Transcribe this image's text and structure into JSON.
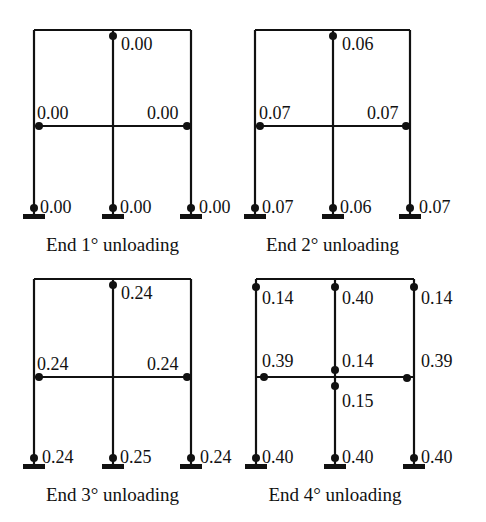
{
  "figure": {
    "type": "frame-damage-diagram"
  },
  "colors": {
    "line": "#111111",
    "hinge": "#111111",
    "background": "#ffffff"
  },
  "panels": [
    {
      "caption": "End 1° unloading",
      "origin": {
        "left": 34,
        "mid": 113,
        "right": 191,
        "top": 30,
        "beam": 126,
        "base": 215
      },
      "hinges": [
        {
          "id": "top-mid",
          "x": 113,
          "y": 36,
          "label": "0.00",
          "lx": 121,
          "ly": 50
        },
        {
          "id": "beam-left",
          "x": 39,
          "y": 126,
          "label": "0.00",
          "lx": 37,
          "ly": 119
        },
        {
          "id": "beam-right",
          "x": 187,
          "y": 126,
          "label": "0.00",
          "lx": 147,
          "ly": 119
        },
        {
          "id": "base-left",
          "x": 34,
          "y": 208,
          "label": "0.00",
          "lx": 40,
          "ly": 213
        },
        {
          "id": "base-mid",
          "x": 113,
          "y": 208,
          "label": "0.00",
          "lx": 120,
          "ly": 213
        },
        {
          "id": "base-right",
          "x": 191,
          "y": 208,
          "label": "0.00",
          "lx": 199,
          "ly": 213
        }
      ]
    },
    {
      "caption": "End 2° unloading",
      "origin": {
        "left": 255,
        "mid": 333,
        "right": 410,
        "top": 30,
        "beam": 126,
        "base": 215
      },
      "hinges": [
        {
          "id": "top-mid",
          "x": 333,
          "y": 36,
          "label": "0.06",
          "lx": 342,
          "ly": 50
        },
        {
          "id": "beam-left",
          "x": 260,
          "y": 126,
          "label": "0.07",
          "lx": 259,
          "ly": 119
        },
        {
          "id": "beam-right",
          "x": 406,
          "y": 126,
          "label": "0.07",
          "lx": 367,
          "ly": 119
        },
        {
          "id": "base-left",
          "x": 255,
          "y": 208,
          "label": "0.07",
          "lx": 262,
          "ly": 213
        },
        {
          "id": "base-mid",
          "x": 333,
          "y": 208,
          "label": "0.06",
          "lx": 340,
          "ly": 213
        },
        {
          "id": "base-right",
          "x": 410,
          "y": 208,
          "label": "0.07",
          "lx": 419,
          "ly": 213
        }
      ]
    },
    {
      "caption": "End 3° unloading",
      "origin": {
        "left": 34,
        "mid": 113,
        "right": 191,
        "top": 279,
        "beam": 377,
        "base": 465
      },
      "hinges": [
        {
          "id": "top-mid",
          "x": 113,
          "y": 285,
          "label": "0.24",
          "lx": 121,
          "ly": 299
        },
        {
          "id": "beam-left",
          "x": 39,
          "y": 377,
          "label": "0.24",
          "lx": 37,
          "ly": 370
        },
        {
          "id": "beam-right",
          "x": 187,
          "y": 377,
          "label": "0.24",
          "lx": 147,
          "ly": 370
        },
        {
          "id": "base-left",
          "x": 34,
          "y": 458,
          "label": "0.24",
          "lx": 42,
          "ly": 463
        },
        {
          "id": "base-mid",
          "x": 113,
          "y": 458,
          "label": "0.25",
          "lx": 120,
          "ly": 463
        },
        {
          "id": "base-right",
          "x": 191,
          "y": 458,
          "label": "0.24",
          "lx": 200,
          "ly": 463
        }
      ]
    },
    {
      "caption": "End 4° unloading",
      "origin": {
        "left": 256,
        "mid": 335,
        "right": 414,
        "top": 279,
        "beam": 377,
        "base": 465
      },
      "hinges": [
        {
          "id": "top-left",
          "x": 256,
          "y": 287,
          "label": "0.14",
          "lx": 262,
          "ly": 304
        },
        {
          "id": "top-mid",
          "x": 335,
          "y": 287,
          "label": "0.40",
          "lx": 342,
          "ly": 304
        },
        {
          "id": "top-right",
          "x": 414,
          "y": 287,
          "label": "0.14",
          "lx": 421,
          "ly": 304
        },
        {
          "id": "beam-left",
          "x": 264,
          "y": 377,
          "label": "0.39",
          "lx": 262,
          "ly": 367
        },
        {
          "id": "beam-mid-upper",
          "x": 335,
          "y": 370,
          "label": "0.14",
          "lx": 342,
          "ly": 367
        },
        {
          "id": "beam-right",
          "x": 407,
          "y": 378,
          "label": "0.39",
          "lx": 421,
          "ly": 367
        },
        {
          "id": "beam-mid-lower",
          "x": 335,
          "y": 386,
          "label": "0.15",
          "lx": 342,
          "ly": 407
        },
        {
          "id": "base-left",
          "x": 256,
          "y": 458,
          "label": "0.40",
          "lx": 262,
          "ly": 463
        },
        {
          "id": "base-mid",
          "x": 335,
          "y": 458,
          "label": "0.40",
          "lx": 342,
          "ly": 463
        },
        {
          "id": "base-right",
          "x": 414,
          "y": 458,
          "label": "0.40",
          "lx": 421,
          "ly": 463
        }
      ]
    }
  ]
}
